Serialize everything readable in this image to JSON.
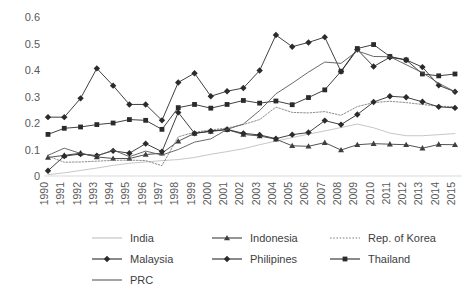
{
  "chart_data": {
    "type": "line",
    "title": "",
    "xlabel": "",
    "ylabel": "",
    "ylim": [
      0,
      0.6
    ],
    "yticks": [
      "0",
      "0.1",
      "0.2",
      "0.3",
      "0.4",
      "0.5",
      "0.6"
    ],
    "ytick_values": [
      0,
      0.1,
      0.2,
      0.3,
      0.4,
      0.5,
      0.6
    ],
    "grid": false,
    "legend_position": "bottom",
    "categories": [
      "1990",
      "1991",
      "1992",
      "1993",
      "1994",
      "1995",
      "1996",
      "1997",
      "1998",
      "1999",
      "2000",
      "2001",
      "2002",
      "2003",
      "2004",
      "2005",
      "2006",
      "2007",
      "2008",
      "2009",
      "2010",
      "2011",
      "2012",
      "2013",
      "2014",
      "2015"
    ],
    "series": [
      {
        "name": "India",
        "marker": "none",
        "color": "#bfbfbf",
        "dash": "none",
        "values": [
          0.005,
          0.012,
          0.021,
          0.03,
          0.04,
          0.048,
          0.053,
          0.058,
          0.062,
          0.07,
          0.082,
          0.092,
          0.103,
          0.118,
          0.132,
          0.145,
          0.158,
          0.17,
          0.183,
          0.196,
          0.182,
          0.162,
          0.152,
          0.152,
          0.156,
          0.16
        ]
      },
      {
        "name": "Indonesia",
        "marker": "triangle",
        "color": "#3f3f3f",
        "dash": "none",
        "values": [
          0.07,
          0.078,
          0.086,
          0.072,
          0.066,
          0.066,
          0.081,
          0.086,
          0.131,
          0.161,
          0.168,
          0.175,
          0.157,
          0.151,
          0.139,
          0.114,
          0.112,
          0.126,
          0.098,
          0.118,
          0.122,
          0.12,
          0.118,
          0.105,
          0.119,
          0.118
        ]
      },
      {
        "name": "Rep. of Korea",
        "marker": "none",
        "color": "#808080",
        "dash": "dotted",
        "values": [
          0.075,
          0.052,
          0.053,
          0.056,
          0.059,
          0.06,
          0.058,
          0.039,
          0.148,
          0.165,
          0.174,
          0.181,
          0.194,
          0.213,
          0.26,
          0.24,
          0.238,
          0.243,
          0.229,
          0.262,
          0.277,
          0.282,
          0.277,
          0.27,
          0.263,
          0.262
        ]
      },
      {
        "name": "Malaysia",
        "marker": "diamond",
        "color": "#2b2b2b",
        "dash": "none",
        "values": [
          0.222,
          0.222,
          0.293,
          0.406,
          0.341,
          0.27,
          0.27,
          0.21,
          0.353,
          0.388,
          0.301,
          0.32,
          0.332,
          0.398,
          0.532,
          0.488,
          0.504,
          0.524,
          0.394,
          0.477,
          0.413,
          0.448,
          0.438,
          0.411,
          0.342,
          0.318
        ]
      },
      {
        "name": "Philipines",
        "marker": "diamond",
        "color": "#2b2b2b",
        "dash": "none",
        "values": [
          0.02,
          0.075,
          0.083,
          0.077,
          0.095,
          0.086,
          0.122,
          0.092,
          0.24,
          0.161,
          0.17,
          0.176,
          0.161,
          0.155,
          0.141,
          0.156,
          0.164,
          0.209,
          0.194,
          0.232,
          0.279,
          0.301,
          0.297,
          0.28,
          0.261,
          0.257
        ]
      },
      {
        "name": "Thailand",
        "marker": "square",
        "color": "#2b2b2b",
        "dash": "none",
        "values": [
          0.157,
          0.18,
          0.185,
          0.194,
          0.2,
          0.213,
          0.21,
          0.176,
          0.258,
          0.27,
          0.256,
          0.27,
          0.285,
          0.275,
          0.283,
          0.269,
          0.296,
          0.325,
          0.395,
          0.481,
          0.496,
          0.451,
          0.438,
          0.385,
          0.378,
          0.385
        ]
      },
      {
        "name": "PRC",
        "marker": "none",
        "color": "#595959",
        "dash": "none",
        "values": [
          0.078,
          0.105,
          0.085,
          0.075,
          0.098,
          0.073,
          0.094,
          0.079,
          0.1,
          0.128,
          0.14,
          0.176,
          0.196,
          0.247,
          0.31,
          0.35,
          0.392,
          0.43,
          0.425,
          0.472,
          0.451,
          0.45,
          0.42,
          0.39,
          0.35,
          0.318
        ]
      }
    ]
  },
  "legend": {
    "items": [
      {
        "label": "India"
      },
      {
        "label": "Indonesia"
      },
      {
        "label": "Rep. of Korea"
      },
      {
        "label": "Malaysia"
      },
      {
        "label": "Philipines"
      },
      {
        "label": "Thailand"
      },
      {
        "label": "PRC"
      }
    ]
  }
}
